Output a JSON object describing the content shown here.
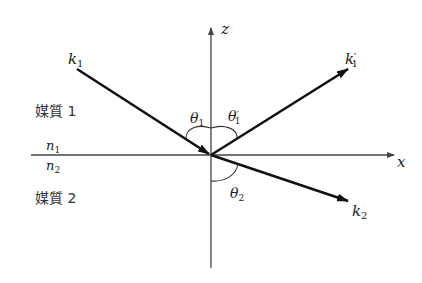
{
  "diagram": {
    "colors": {
      "background": "#ffffff",
      "axis": "#444444",
      "ray": "#111111",
      "text": "#222222"
    },
    "axes": {
      "z_label": "z",
      "x_label": "x"
    },
    "media": {
      "medium1_label": "媒質 1",
      "medium2_label": "媒質 2",
      "n1": {
        "base": "n",
        "sub": "1"
      },
      "n2": {
        "base": "n",
        "sub": "2"
      }
    },
    "rays": {
      "incident": {
        "base": "k",
        "sub": "1",
        "prime": ""
      },
      "reflected": {
        "base": "k",
        "sub": "1",
        "prime": "′"
      },
      "refracted": {
        "base": "k",
        "sub": "2",
        "prime": ""
      }
    },
    "angles": {
      "incidence": {
        "base": "θ",
        "sub": "1",
        "prime": ""
      },
      "reflection": {
        "base": "θ",
        "sub": "1",
        "prime": "′"
      },
      "refraction": {
        "base": "θ",
        "sub": "2",
        "prime": ""
      }
    }
  }
}
